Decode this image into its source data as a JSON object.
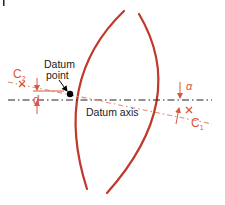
{
  "diagram": {
    "labels": {
      "datum_point_line1": "Datum",
      "datum_point_line2": "point",
      "datum_axis": "Datum axis",
      "c2": "C",
      "c2_sub": "2",
      "c1": "C",
      "c1_sub": "1",
      "d": "d",
      "alpha": "α"
    },
    "colors": {
      "lens_arc": "#c0392b",
      "annotation": "#d9573a",
      "tilted_axis": "#e28c72",
      "datum_axis": "#222222",
      "text": "#222222",
      "datum_point": "#000000"
    }
  }
}
